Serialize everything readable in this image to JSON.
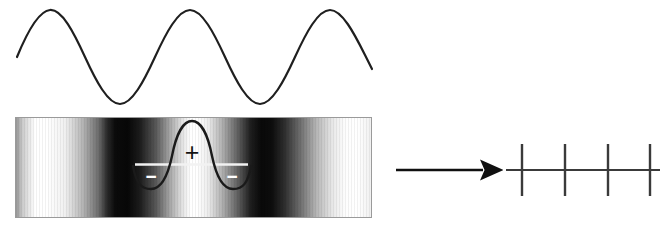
{
  "figure": {
    "title": "",
    "background_color": "#ffffff",
    "stroke_color": "#1a1a1a",
    "panels": [
      {
        "name": "sine-wave-panel",
        "description": "Cosine/sine wave profile above the fringe band",
        "x": 15,
        "y": 2,
        "width": 358,
        "height": 110
      },
      {
        "name": "fringe-band-panel",
        "description": "Grayscale interference fringe band with wavelet overlay",
        "x": 15,
        "y": 117,
        "width": 357,
        "height": 101
      },
      {
        "name": "arrow-panel",
        "description": "Rightward implication arrow",
        "x": 395,
        "y": 162,
        "width": 97,
        "height": 16
      },
      {
        "name": "comb-panel",
        "description": "Horizontal axis crossed by four vertical lines",
        "x": 505,
        "y": 140,
        "width": 155,
        "height": 58
      }
    ],
    "wave": {
      "label": "sine-wave",
      "stroke_width": 2.2,
      "x_start": 17,
      "x_end": 372,
      "baseline_y": 57,
      "amplitude": 47,
      "peaks_x": [
        50,
        190,
        330
      ],
      "troughs_x": [
        120,
        260
      ],
      "peak_y": 10,
      "trough_y": 104
    },
    "fringes": {
      "label": "interference-fringes",
      "left": 15,
      "top": 117,
      "width": 357,
      "height": 101,
      "border_color": "#9a9a9a",
      "bright_centers_x": [
        35,
        190,
        340
      ],
      "dark_centers_x": [
        107,
        262
      ],
      "bright_color": "#ffffff",
      "dark_color": "#0b0b0b"
    },
    "wavelet": {
      "label": "wavelet-overlay",
      "stroke_color": "#1a1a1a",
      "stroke_width": 2.4,
      "center_x": 192,
      "peak_y": 121,
      "baseline_y": 164,
      "trough_y": 189,
      "left_x": 133,
      "right_x": 251,
      "baseline_color": "#f2f2f2",
      "baseline_x_start": 135,
      "baseline_x_end": 248
    },
    "annotations": [
      {
        "name": "plus-sign",
        "symbol": "+",
        "x": 192,
        "y": 153,
        "color": "#141414",
        "font_size": 22
      },
      {
        "name": "minus-sign-left",
        "symbol": "−",
        "x": 151,
        "y": 178,
        "color": "#ffffff",
        "font_size": 16
      },
      {
        "name": "minus-sign-right",
        "symbol": "−",
        "x": 232,
        "y": 178,
        "color": "#ffffff",
        "font_size": 16
      }
    ],
    "arrow": {
      "label": "implies-arrow",
      "x_start": 396,
      "x_end": 490,
      "y": 170,
      "stroke_width": 2.6,
      "head_length": 16,
      "head_width": 13,
      "color": "#101010"
    },
    "comb": {
      "label": "spatial-frequency-comb",
      "axis_y": 170,
      "axis_x_start": 506,
      "axis_x_end": 660,
      "axis_stroke_width": 2.2,
      "tick_height_up": 26,
      "tick_height_down": 26,
      "tick_stroke_width": 2.4,
      "ticks_x": [
        522,
        565,
        608,
        650
      ],
      "color": "#3a3a3a"
    }
  }
}
